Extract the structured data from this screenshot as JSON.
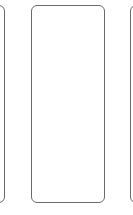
{
  "cards": [
    {
      "position": "left",
      "partial": true
    },
    {
      "position": "center",
      "partial": false
    },
    {
      "position": "right",
      "partial": true
    }
  ],
  "colors": {
    "border": "#6a6a6a",
    "background": "#ffffff"
  }
}
